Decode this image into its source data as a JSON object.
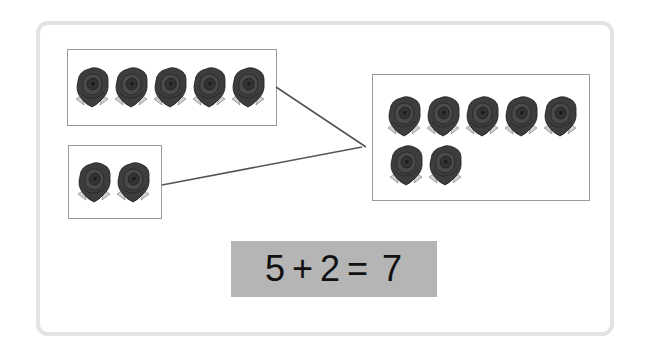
{
  "diagram": {
    "groups": [
      {
        "id": "group-a",
        "count": 5,
        "item": "rose-icon"
      },
      {
        "id": "group-b",
        "count": 2,
        "item": "rose-icon"
      },
      {
        "id": "group-total",
        "count": 7,
        "item": "rose-icon"
      }
    ],
    "connections": [
      {
        "from": "group-a",
        "to": "group-total"
      },
      {
        "from": "group-b",
        "to": "group-total"
      }
    ]
  },
  "equation": {
    "addend1": "5",
    "plus": "+",
    "addend2": "2",
    "equals": "=",
    "sum": "7"
  },
  "colors": {
    "frame": "#e3e3e3",
    "box_border": "#9a9a9a",
    "equation_bg": "#b5b5b5",
    "rose": "#3a3a3a",
    "line": "#555555"
  }
}
